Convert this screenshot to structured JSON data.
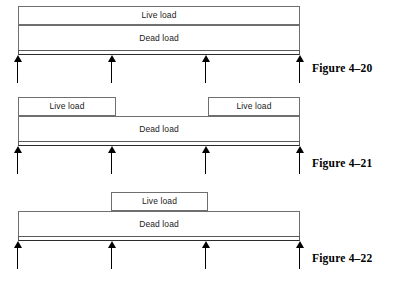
{
  "page": {
    "width": 395,
    "height": 285,
    "background": "#ffffff",
    "line_color": "#6f6f6f",
    "arrow_color": "#000000",
    "text_color": "#1a1a1a"
  },
  "labels": {
    "live_load": "Live load",
    "dead_load": "Dead load"
  },
  "figures": [
    {
      "id": "figure-4-20",
      "caption": "Figure 4–20",
      "caption_x": 312,
      "caption_y": 62,
      "beam": {
        "x": 18,
        "width": 282,
        "strip_y": 50,
        "strip_height": 5
      },
      "supports": [
        {
          "x": 18,
          "y": 55,
          "height": 28
        },
        {
          "x": 112,
          "y": 55,
          "height": 28
        },
        {
          "x": 206,
          "y": 55,
          "height": 28
        },
        {
          "x": 300,
          "y": 55,
          "height": 28
        }
      ],
      "boxes": [
        {
          "kind": "live",
          "label": "Live load",
          "x": 18,
          "y": 6,
          "width": 282,
          "height": 19
        },
        {
          "kind": "dead",
          "label": "Dead load",
          "x": 18,
          "y": 25,
          "width": 282,
          "height": 25
        }
      ]
    },
    {
      "id": "figure-4-21",
      "caption": "Figure 4–21",
      "caption_x": 312,
      "caption_y": 157,
      "beam": {
        "x": 18,
        "width": 282,
        "strip_y": 141,
        "strip_height": 5
      },
      "supports": [
        {
          "x": 18,
          "y": 146,
          "height": 28
        },
        {
          "x": 112,
          "y": 146,
          "height": 28
        },
        {
          "x": 206,
          "y": 146,
          "height": 28
        },
        {
          "x": 300,
          "y": 146,
          "height": 28
        }
      ],
      "boxes": [
        {
          "kind": "live",
          "label": "Live load",
          "x": 18,
          "y": 97,
          "width": 98,
          "height": 19
        },
        {
          "kind": "live",
          "label": "Live load",
          "x": 208,
          "y": 97,
          "width": 92,
          "height": 19
        },
        {
          "kind": "dead",
          "label": "Dead load",
          "x": 18,
          "y": 116,
          "width": 282,
          "height": 25
        }
      ]
    },
    {
      "id": "figure-4-22",
      "caption": "Figure 4–22",
      "caption_x": 312,
      "caption_y": 252,
      "beam": {
        "x": 18,
        "width": 282,
        "strip_y": 236,
        "strip_height": 5
      },
      "supports": [
        {
          "x": 18,
          "y": 241,
          "height": 28
        },
        {
          "x": 112,
          "y": 241,
          "height": 28
        },
        {
          "x": 206,
          "y": 241,
          "height": 28
        },
        {
          "x": 300,
          "y": 241,
          "height": 28
        }
      ],
      "boxes": [
        {
          "kind": "live",
          "label": "Live load",
          "x": 111,
          "y": 192,
          "width": 97,
          "height": 19
        },
        {
          "kind": "dead",
          "label": "Dead load",
          "x": 18,
          "y": 211,
          "width": 282,
          "height": 25
        }
      ]
    }
  ]
}
